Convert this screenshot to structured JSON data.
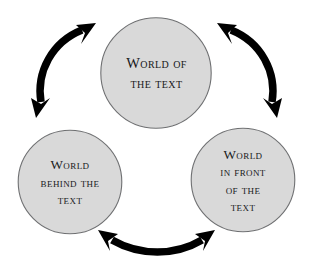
{
  "diagram": {
    "type": "cycle",
    "title": "",
    "background_color": "#ffffff",
    "node_fill_color": "#d9d9d9",
    "node_stroke_color": "#6f7072",
    "arrow_color": "#000000",
    "text_color": "#17181a",
    "nodes": [
      {
        "id": "world-of-text",
        "position": "top",
        "lines": [
          "World of",
          "the text"
        ],
        "line1": "World of",
        "line2": "the text",
        "line3": "",
        "line4": "",
        "center_x": 156,
        "center_y": 73,
        "diameter": 111
      },
      {
        "id": "world-behind-text",
        "position": "bottom-left",
        "lines": [
          "World",
          "behind the",
          "text"
        ],
        "line1": "World",
        "line2": "behind the",
        "line3": "text",
        "line4": "",
        "center_x": 70,
        "center_y": 182,
        "diameter": 104
      },
      {
        "id": "world-in-front-text",
        "position": "bottom-right",
        "lines": [
          "World",
          "in front",
          "of the",
          "text"
        ],
        "line1": "World",
        "line2": "in front",
        "line3": "of the",
        "line4": "text",
        "center_x": 243,
        "center_y": 180,
        "diameter": 104
      }
    ],
    "connectors": [
      {
        "id": "arrow-left-top",
        "from": "world-behind-text",
        "to": "world-of-text",
        "style": "curved",
        "heads": "double"
      },
      {
        "id": "arrow-top-right",
        "from": "world-of-text",
        "to": "world-in-front-text",
        "style": "curved",
        "heads": "double"
      },
      {
        "id": "arrow-bottom",
        "from": "world-behind-text",
        "to": "world-in-front-text",
        "style": "curved",
        "heads": "double"
      }
    ]
  }
}
